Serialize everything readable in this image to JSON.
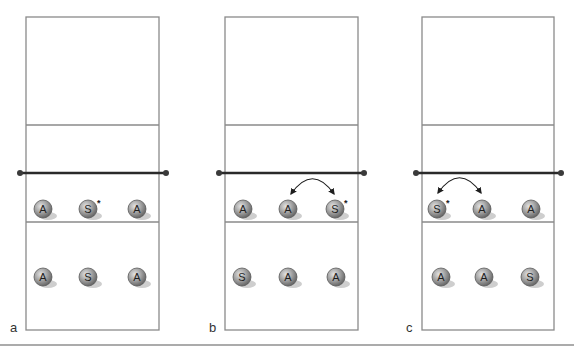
{
  "figure": {
    "panels": [
      {
        "label": "a",
        "court": {
          "left": 26,
          "right": 159,
          "top": 17,
          "attack_line_top": 125,
          "net_y": 173,
          "center_line": 222,
          "bottom": 330,
          "post_left": 20,
          "post_right": 166
        },
        "players": [
          {
            "role": "A",
            "x": 43,
            "y": 209,
            "starred": false
          },
          {
            "role": "S",
            "x": 88,
            "y": 209,
            "starred": true
          },
          {
            "role": "A",
            "x": 137,
            "y": 209,
            "starred": false
          },
          {
            "role": "A",
            "x": 43,
            "y": 277,
            "starred": false
          },
          {
            "role": "S",
            "x": 88,
            "y": 277,
            "starred": false
          },
          {
            "role": "A",
            "x": 137,
            "y": 277,
            "starred": false
          }
        ],
        "swap_arrow": null
      },
      {
        "label": "b",
        "court": {
          "left": 225,
          "right": 358,
          "top": 17,
          "attack_line_top": 125,
          "net_y": 173,
          "center_line": 222,
          "bottom": 330,
          "post_left": 219,
          "post_right": 364
        },
        "players": [
          {
            "role": "A",
            "x": 243,
            "y": 209,
            "starred": false
          },
          {
            "role": "A",
            "x": 288,
            "y": 209,
            "starred": false
          },
          {
            "role": "S",
            "x": 335,
            "y": 209,
            "starred": true
          },
          {
            "role": "S",
            "x": 242,
            "y": 277,
            "starred": false
          },
          {
            "role": "A",
            "x": 288,
            "y": 277,
            "starred": false
          },
          {
            "role": "A",
            "x": 336,
            "y": 277,
            "starred": false
          }
        ],
        "swap_arrow": {
          "x1": 291,
          "y1": 194,
          "x2": 334,
          "y2": 194,
          "peak_y": 178
        }
      },
      {
        "label": "c",
        "court": {
          "left": 422,
          "right": 554,
          "top": 17,
          "attack_line_top": 125,
          "net_y": 173,
          "center_line": 222,
          "bottom": 330,
          "post_left": 416,
          "post_right": 561
        },
        "players": [
          {
            "role": "S",
            "x": 437,
            "y": 209,
            "starred": true
          },
          {
            "role": "A",
            "x": 482,
            "y": 209,
            "starred": false
          },
          {
            "role": "A",
            "x": 531,
            "y": 209,
            "starred": false
          },
          {
            "role": "A",
            "x": 441,
            "y": 277,
            "starred": false
          },
          {
            "role": "A",
            "x": 484,
            "y": 277,
            "starred": false
          },
          {
            "role": "S",
            "x": 530,
            "y": 277,
            "starred": false
          }
        ],
        "swap_arrow": {
          "x1": 438,
          "y1": 193,
          "x2": 481,
          "y2": 193,
          "peak_y": 177
        }
      }
    ],
    "star_symbol": "*",
    "bottom_rule_y": 345,
    "colors": {
      "court_line": "#8a8a8a",
      "net": "#2a2a2a",
      "ball_light": "#d0d0d0",
      "ball_dark": "#6e6e6e",
      "shadow": "#c6c6c6"
    }
  }
}
